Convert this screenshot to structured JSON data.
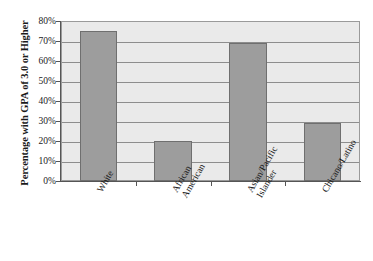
{
  "chart_data": {
    "type": "bar",
    "title": "",
    "subtitle": "",
    "xlabel": "",
    "ylabel": "Percentage with GPA of 3.0 or Higher",
    "categories": [
      "White",
      "African American",
      "Asian/Pacific Islander",
      "Chicano/Latino"
    ],
    "category_lines": [
      [
        "White"
      ],
      [
        "African",
        "American"
      ],
      [
        "Asian/Pacific",
        "Islander"
      ],
      [
        "Chicano/Latino"
      ]
    ],
    "values": [
      75,
      20,
      69,
      29
    ],
    "value_labels": [
      "75%",
      "20%",
      "69%",
      "29%"
    ],
    "ylim": [
      0,
      80
    ],
    "ytick_values": [
      80,
      70,
      60,
      50,
      40,
      30,
      20,
      10,
      0
    ],
    "ytick_labels": [
      "80%",
      "70%",
      "60%",
      "50%",
      "40%",
      "30%",
      "20%",
      "10%",
      "0%"
    ],
    "grid": true,
    "grid_axis": "y",
    "legend": false,
    "legend_position": "none",
    "orientation": "vertical",
    "series": [
      {
        "name": "Percentage with GPA of 3.0 or Higher",
        "values": [
          75,
          20,
          69,
          29
        ]
      }
    ]
  },
  "colors": {
    "bar_fill": "#9d9d9d",
    "bar_border": "#6f6f6f",
    "plot_background": "#eaeaea",
    "gridline": "#8d8d8d",
    "axis_line": "#555555",
    "page_background": "#ffffff",
    "text": "#1a1a1a"
  }
}
